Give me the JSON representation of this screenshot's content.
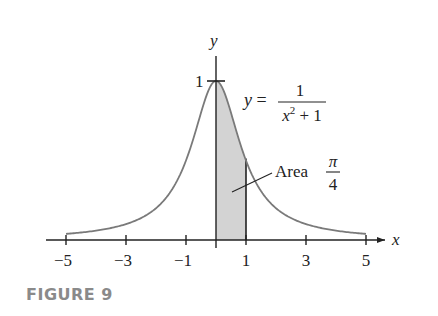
{
  "figure": {
    "caption": "FIGURE 9"
  },
  "chart_data": {
    "type": "area",
    "title": "",
    "function": "y = 1/(x^2+1)",
    "equation_label": {
      "lhs": "y =",
      "numerator": "1",
      "denominator_base": "x",
      "denominator_exp": "2",
      "denominator_rest": " + 1"
    },
    "xlabel": "x",
    "ylabel": "y",
    "xlim": [
      -5,
      5
    ],
    "ylim": [
      0,
      1
    ],
    "x_ticks": [
      -5,
      -3,
      -1,
      1,
      3,
      5
    ],
    "x_tick_labels": [
      "−5",
      "−3",
      "−1",
      "1",
      "3",
      "5"
    ],
    "y_ticks": [
      1
    ],
    "y_tick_labels": [
      "1"
    ],
    "shaded_region": {
      "from": 0,
      "to": 1,
      "color": "#d3d3d3"
    },
    "annotation": {
      "text": "Area",
      "fraction_num": "π",
      "fraction_den": "4"
    },
    "series": [
      {
        "name": "y = 1/(x^2+1)",
        "x": [
          -5,
          -4.5,
          -4,
          -3.5,
          -3,
          -2.5,
          -2,
          -1.5,
          -1,
          -0.75,
          -0.5,
          -0.25,
          0,
          0.25,
          0.5,
          0.75,
          1,
          1.5,
          2,
          2.5,
          3,
          3.5,
          4,
          4.5,
          5
        ],
        "values": [
          0.038,
          0.047,
          0.059,
          0.075,
          0.1,
          0.138,
          0.2,
          0.308,
          0.5,
          0.64,
          0.8,
          0.941,
          1,
          0.941,
          0.8,
          0.64,
          0.5,
          0.308,
          0.2,
          0.138,
          0.1,
          0.075,
          0.059,
          0.047,
          0.038
        ]
      }
    ],
    "colors": {
      "curve": "#7a7a7a",
      "axis": "#222222",
      "shade": "#d3d3d3",
      "caption": "#8a8a8a"
    },
    "grid": false
  }
}
